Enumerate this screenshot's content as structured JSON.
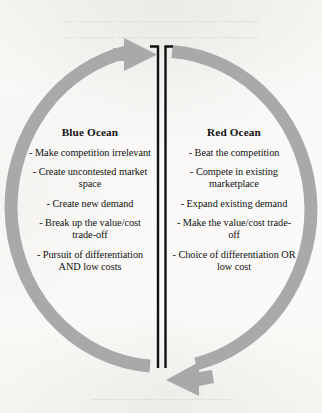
{
  "diagram": {
    "ring_color": "#a9a9a9",
    "divider_color": "#111111",
    "text_color": "#111111",
    "background_color": "#f8f7f5"
  },
  "arrows": {
    "top": {
      "name": "top-arc-arrow",
      "direction": "right",
      "description": "left arc sweeping upward, arrowhead pointing right into the central gap"
    },
    "bottom": {
      "name": "bottom-arc-arrow",
      "direction": "left",
      "description": "right arc sweeping downward, arrowhead pointing left into the central gap"
    }
  },
  "divider": {
    "name": "central-double-bar-divider",
    "bars": 2,
    "caps": "top-only-outward"
  },
  "columns": [
    {
      "id": "blue-ocean",
      "title": "Blue Ocean",
      "items": [
        "- Make competition irrelevant",
        "- Create uncontested market space",
        "- Create new demand",
        "- Break up the value/cost trade-off",
        "- Pursuit of differentiation AND low costs"
      ]
    },
    {
      "id": "red-ocean",
      "title": "Red Ocean",
      "items": [
        "- Beat the competition",
        "- Compete in existing marketplace",
        "- Expand existing demand",
        "- Make the value/cost trade-off",
        "- Choice of differentiation OR low cost"
      ]
    }
  ],
  "artifacts": {
    "top_bleed": "— ——— —— ———— —— ———",
    "bottom_bleed": "——— —— ———— ——"
  }
}
